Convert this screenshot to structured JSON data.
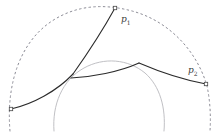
{
  "figure": {
    "background_color": "#ffffff",
    "width": 218,
    "height": 132
  },
  "colors": {
    "curve_dark": "#2b2b2b",
    "dashed_arc": "#8c8c96",
    "inner_circle": "#b9b9bd",
    "marker_stroke": "#4a4a4a",
    "marker_fill": "#ffffff",
    "label": "#3b3b3b"
  },
  "labels": [
    {
      "id": "p1",
      "base": "p",
      "subscript": "1",
      "text": "p1",
      "x": 121,
      "y": 22
    },
    {
      "id": "p2",
      "base": "p",
      "subscript": "2",
      "text": "p2",
      "x": 188,
      "y": 73
    }
  ],
  "points": [
    {
      "id": "p1-marker",
      "name": "point-p1",
      "x": 115,
      "y": 8
    },
    {
      "id": "p2-marker",
      "name": "point-p2",
      "x": 206,
      "y": 84
    },
    {
      "id": "left-marker",
      "name": "point-left-endpoint",
      "x": 11,
      "y": 109
    }
  ],
  "shapes": {
    "dashed_arc": {
      "name": "boundary-circle-dashed",
      "path": "M 10 131 C 6 84 20 42 52 21 C 78 4 106 4 132 11 C 166 20 196 48 207 86 C 210 100 211 116 210 131",
      "dash": "1.6 3.2",
      "stroke_width": 1.0
    },
    "inner_circle": {
      "name": "inner-circle-solid",
      "path": "M 54 131 C 52 105 62 80 84 68 C 104 57 128 59 145 73 C 160 86 166 108 164 131",
      "stroke_width": 0.9
    },
    "geodesic_upper": {
      "name": "geodesic-curve-p1-to-junction",
      "path": "M 115 8 C 104 28 90 50 73 74",
      "stroke_width": 1.1
    },
    "geodesic_lower_left": {
      "name": "geodesic-curve-junction-to-left",
      "path": "M 73 74 C 57 91 33 104 11 109",
      "stroke_width": 1.1
    },
    "geodesic_middle": {
      "name": "geodesic-curve-junction-to-apex",
      "path": "M 71 78 C 92 77 119 72 139 63",
      "stroke_width": 1.1
    },
    "geodesic_right": {
      "name": "geodesic-curve-apex-to-p2",
      "path": "M 139 63 C 160 72 184 80 206 84",
      "stroke_width": 1.1
    }
  },
  "marker": {
    "size": 3.4
  }
}
